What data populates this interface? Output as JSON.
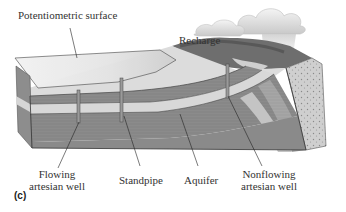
{
  "figure": {
    "panel_label": "(c)",
    "labels": {
      "potentiometric_surface": "Potentiometric surface",
      "recharge": "Recharge",
      "flowing_well_line1": "Flowing",
      "flowing_well_line2": "artesian well",
      "standpipe": "Standpipe",
      "aquifer": "Aquifer",
      "nonflowing_well_line1": "Nonflowing",
      "nonflowing_well_line2": "artesian well"
    }
  }
}
